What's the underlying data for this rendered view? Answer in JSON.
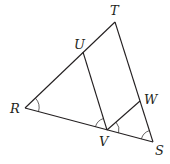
{
  "figure": {
    "type": "geometry-diagram",
    "points": [
      {
        "label": "T",
        "x": 115,
        "y": 22,
        "lx": 110,
        "ly": 15
      },
      {
        "label": "U",
        "x": 83,
        "y": 52,
        "lx": 74,
        "ly": 49
      },
      {
        "label": "R",
        "x": 25,
        "y": 108,
        "lx": 10,
        "ly": 113
      },
      {
        "label": "W",
        "x": 140,
        "y": 101,
        "lx": 144,
        "ly": 104
      },
      {
        "label": "V",
        "x": 107,
        "y": 130,
        "lx": 99,
        "ly": 146
      },
      {
        "label": "S",
        "x": 153,
        "y": 142,
        "lx": 155,
        "ly": 155
      }
    ],
    "segments": [
      [
        "R",
        "T"
      ],
      [
        "R",
        "S"
      ],
      [
        "T",
        "S"
      ],
      [
        "U",
        "V"
      ],
      [
        "V",
        "W"
      ]
    ],
    "angle_marks": [
      "R",
      "UVR",
      "WVS",
      "S"
    ]
  }
}
